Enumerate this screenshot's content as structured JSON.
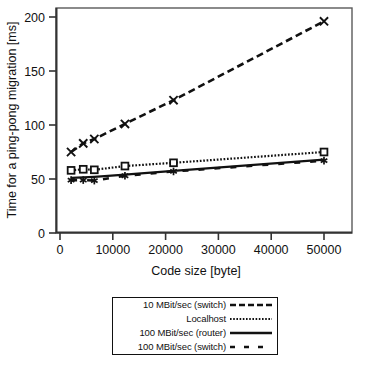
{
  "figure": {
    "alt_name": "ping-pong-migration-time-vs-code-size-chart"
  },
  "chart_data": {
    "type": "line",
    "title": "",
    "xlabel": "Code size [byte]",
    "ylabel": "Time for a ping-pong migration [ms]",
    "xlim": [
      0,
      55000
    ],
    "ylim": [
      0,
      215
    ],
    "xticks": [
      0,
      10000,
      20000,
      30000,
      40000,
      50000
    ],
    "xticklabels": [
      "0",
      "10000",
      "20000",
      "30000",
      "40000",
      "50000"
    ],
    "yticks": [
      0,
      50,
      100,
      150,
      200
    ],
    "yticklabels": [
      "0",
      "50",
      "100",
      "150",
      "200"
    ],
    "grid": false,
    "legend_position": "below-center",
    "series": [
      {
        "name": "10 MBit/sec (switch)",
        "linestyle": "dashed",
        "marker": "x",
        "color": "#111111",
        "x": [
          2100,
          4400,
          6500,
          12300,
          21500,
          50000
        ],
        "y": [
          75,
          83,
          87,
          101,
          123,
          196
        ]
      },
      {
        "name": "Localhost",
        "linestyle": "dotted",
        "marker": "square",
        "color": "#111111",
        "x": [
          2100,
          4400,
          6500,
          12300,
          21500,
          50000
        ],
        "y": [
          58,
          59,
          58.5,
          62,
          65,
          75
        ]
      },
      {
        "name": "100 MBit/sec (router)",
        "linestyle": "solid",
        "marker": "none",
        "color": "#111111",
        "x": [
          2100,
          4400,
          6500,
          12300,
          21500,
          50000
        ],
        "y": [
          51,
          51.5,
          52,
          54,
          57.5,
          68
        ]
      },
      {
        "name": "100 MBit/sec (switch)",
        "linestyle": "long-dash",
        "marker": "asterisk",
        "color": "#111111",
        "x": [
          2100,
          4400,
          6500,
          12300,
          21500,
          50000
        ],
        "y": [
          49,
          49,
          48.5,
          53,
          57,
          67
        ]
      }
    ]
  },
  "legend": {
    "entries": [
      {
        "label": "10 MBit/sec (switch)",
        "style": "dashed"
      },
      {
        "label": "Localhost",
        "style": "dotted"
      },
      {
        "label": "100 MBit/sec (router)",
        "style": "solid"
      },
      {
        "label": "100 MBit/sec (switch)",
        "style": "long-dash"
      }
    ]
  }
}
